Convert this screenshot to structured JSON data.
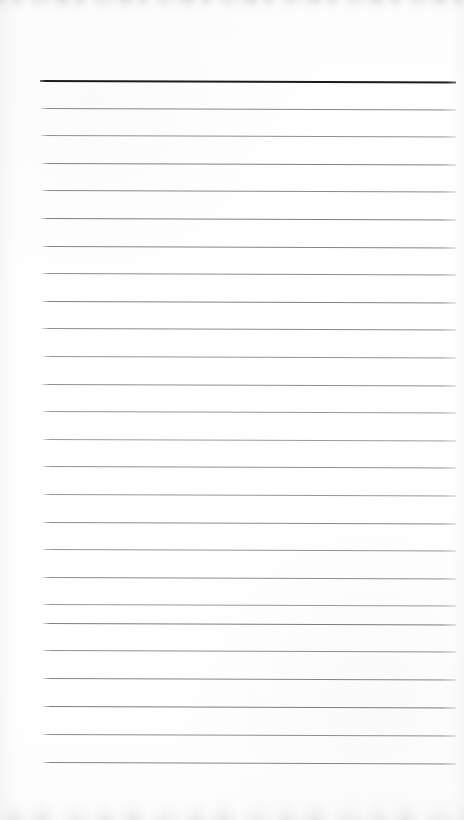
{
  "document": {
    "kind": "scanned-lined-notepad-page",
    "page_text": "",
    "has_handwriting": false,
    "has_printed_text": false
  },
  "canvas": {
    "width": 464,
    "height": 820,
    "background_color": "#fefefe",
    "paper_tint": "#fdfdfe"
  },
  "layout": {
    "left_margin_x": 41,
    "right_margin_x": 456,
    "first_line_y": 80,
    "last_line_y": 762,
    "line_spacing": 27.3,
    "line_count": 26
  },
  "ruling": {
    "header_rule_color": "#1c1c1c",
    "header_rule_thickness": 2,
    "body_rule_color": "#8e9094",
    "body_rule_thickness": 1,
    "slope_degrees": 0.22
  },
  "scan_artifacts": {
    "top_edge_band_color": "#c4c5c8",
    "bottom_edge_band_color": "#c9cacd",
    "side_vignette_color": "#cdced2"
  },
  "lines": [
    {
      "index": 1,
      "y": 80.0,
      "x1": 40,
      "x2": 456,
      "color": "#1c1c1c",
      "thickness": 2.0,
      "emphasis": "header"
    },
    {
      "index": 2,
      "y": 107.8,
      "x1": 41,
      "x2": 456,
      "color": "#85878b",
      "thickness": 1.1,
      "emphasis": "body"
    },
    {
      "index": 3,
      "y": 135.3,
      "x1": 41,
      "x2": 456,
      "color": "#8e9094",
      "thickness": 1.0,
      "emphasis": "body"
    },
    {
      "index": 4,
      "y": 162.9,
      "x1": 42,
      "x2": 456,
      "color": "#7f8185",
      "thickness": 1.0,
      "emphasis": "body"
    },
    {
      "index": 5,
      "y": 190.4,
      "x1": 42,
      "x2": 456,
      "color": "#888a8e",
      "thickness": 1.0,
      "emphasis": "body"
    },
    {
      "index": 6,
      "y": 218.0,
      "x1": 41,
      "x2": 456,
      "color": "#7d7f83",
      "thickness": 1.1,
      "emphasis": "body"
    },
    {
      "index": 7,
      "y": 245.6,
      "x1": 42,
      "x2": 456,
      "color": "#828488",
      "thickness": 1.0,
      "emphasis": "body"
    },
    {
      "index": 8,
      "y": 273.2,
      "x1": 42,
      "x2": 456,
      "color": "#8b8d91",
      "thickness": 1.0,
      "emphasis": "body"
    },
    {
      "index": 9,
      "y": 300.8,
      "x1": 42,
      "x2": 456,
      "color": "#7f8185",
      "thickness": 1.0,
      "emphasis": "body"
    },
    {
      "index": 10,
      "y": 328.4,
      "x1": 42,
      "x2": 456,
      "color": "#898b8f",
      "thickness": 1.0,
      "emphasis": "body"
    },
    {
      "index": 11,
      "y": 356.0,
      "x1": 43,
      "x2": 456,
      "color": "#92949a",
      "thickness": 1.0,
      "emphasis": "body"
    },
    {
      "index": 12,
      "y": 383.5,
      "x1": 42,
      "x2": 456,
      "color": "#8d8f94",
      "thickness": 1.0,
      "emphasis": "body"
    },
    {
      "index": 13,
      "y": 411.1,
      "x1": 43,
      "x2": 456,
      "color": "#96989d",
      "thickness": 1.0,
      "emphasis": "body"
    },
    {
      "index": 14,
      "y": 438.7,
      "x1": 43,
      "x2": 456,
      "color": "#9a9ca1",
      "thickness": 1.0,
      "emphasis": "body"
    },
    {
      "index": 15,
      "y": 466.3,
      "x1": 43,
      "x2": 456,
      "color": "#8f9196",
      "thickness": 1.0,
      "emphasis": "body"
    },
    {
      "index": 16,
      "y": 493.9,
      "x1": 43,
      "x2": 456,
      "color": "#95979c",
      "thickness": 1.0,
      "emphasis": "body"
    },
    {
      "index": 17,
      "y": 521.5,
      "x1": 43,
      "x2": 456,
      "color": "#8a8c91",
      "thickness": 1.0,
      "emphasis": "body"
    },
    {
      "index": 18,
      "y": 549.1,
      "x1": 43,
      "x2": 456,
      "color": "#939599",
      "thickness": 1.0,
      "emphasis": "body"
    },
    {
      "index": 19,
      "y": 576.6,
      "x1": 43,
      "x2": 456,
      "color": "#8b8d92",
      "thickness": 1.0,
      "emphasis": "body"
    },
    {
      "index": 20,
      "y": 604.2,
      "x1": 43,
      "x2": 456,
      "color": "#97999e",
      "thickness": 1.0,
      "emphasis": "body"
    },
    {
      "index": 21,
      "y": 623.0,
      "x1": 43,
      "x2": 456,
      "color": "#7a7c80",
      "thickness": 1.1,
      "emphasis": "body"
    },
    {
      "index": 22,
      "y": 650.4,
      "x1": 43,
      "x2": 456,
      "color": "#8e9095",
      "thickness": 1.0,
      "emphasis": "body"
    },
    {
      "index": 23,
      "y": 678.0,
      "x1": 43,
      "x2": 456,
      "color": "#84868a",
      "thickness": 1.0,
      "emphasis": "body"
    },
    {
      "index": 24,
      "y": 706.0,
      "x1": 43,
      "x2": 456,
      "color": "#7b7d81",
      "thickness": 1.1,
      "emphasis": "body"
    },
    {
      "index": 25,
      "y": 734.0,
      "x1": 43,
      "x2": 456,
      "color": "#8c8e93",
      "thickness": 1.0,
      "emphasis": "body"
    },
    {
      "index": 26,
      "y": 762.0,
      "x1": 43,
      "x2": 456,
      "color": "#83858a",
      "thickness": 1.1,
      "emphasis": "body"
    }
  ]
}
